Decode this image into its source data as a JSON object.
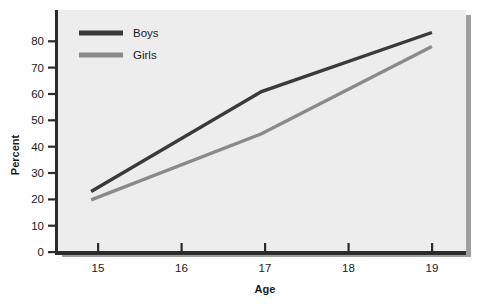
{
  "chart_data": {
    "type": "line",
    "title": "",
    "xlabel": "Age",
    "ylabel": "Percent",
    "x": [
      15,
      16,
      17,
      18,
      19
    ],
    "categories": [
      "15",
      "16",
      "17",
      "18",
      "19"
    ],
    "xlim": [
      14.6,
      19.4
    ],
    "ylim": [
      0,
      86
    ],
    "xticks": [
      "15",
      "16",
      "17",
      "18",
      "19"
    ],
    "yticks": [
      "0",
      "10",
      "20",
      "30",
      "40",
      "50",
      "60",
      "70",
      "80"
    ],
    "ytick_values": [
      0,
      10,
      20,
      30,
      40,
      50,
      60,
      70,
      80
    ],
    "grid": false,
    "legend_position": "top-left",
    "series": [
      {
        "name": "Boys",
        "color": "#3a3a3a",
        "x": [
          15,
          17,
          19
        ],
        "values": [
          21.5,
          57,
          78
        ]
      },
      {
        "name": "Girls",
        "color": "#8a8a8a",
        "x": [
          15,
          17,
          19
        ],
        "values": [
          18.5,
          42,
          73
        ]
      }
    ]
  },
  "legend": {
    "items": [
      {
        "label": "Boys",
        "color": "#3a3a3a"
      },
      {
        "label": "Girls",
        "color": "#8a8a8a"
      }
    ]
  },
  "axes": {
    "y_title": "Percent",
    "x_title": "Age",
    "y_tick_0": "0",
    "y_tick_10": "10",
    "y_tick_20": "20",
    "y_tick_30": "30",
    "y_tick_40": "40",
    "y_tick_50": "50",
    "y_tick_60": "60",
    "y_tick_70": "70",
    "y_tick_80": "80",
    "x_tick_15": "15",
    "x_tick_16": "16",
    "x_tick_17": "17",
    "x_tick_18": "18",
    "x_tick_19": "19"
  },
  "colors": {
    "plot_background": "#ededed",
    "axis": "#2b2b2b",
    "shadow": "#9a9a9a",
    "page_background": "#ffffff",
    "boys": "#3a3a3a",
    "girls": "#8a8a8a"
  }
}
